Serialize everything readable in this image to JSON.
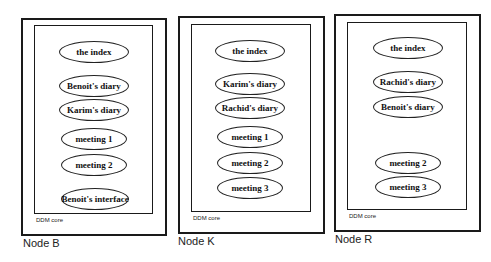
{
  "nodes": [
    {
      "label": "Node B",
      "core_label": "DDM core",
      "documents": [
        "the index",
        "Benoit's diary",
        "Karim's diary",
        "meeting 1",
        "meeting 2",
        "Benoit's interface"
      ]
    },
    {
      "label": "Node K",
      "core_label": "DDM core",
      "documents": [
        "the index",
        "Karim's diary",
        "Rachid's diary",
        "meeting 1",
        "meeting 2",
        "meeting 3"
      ]
    },
    {
      "label": "Node R",
      "core_label": "DDM core",
      "documents": [
        "the index",
        "Rachid's diary",
        "Benoit's diary",
        "meeting 2",
        "meeting 3"
      ]
    }
  ]
}
